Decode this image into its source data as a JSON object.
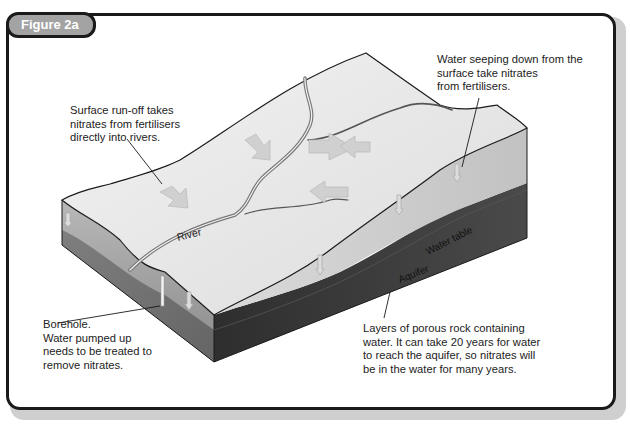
{
  "figure": {
    "label": "Figure 2a"
  },
  "diagram": {
    "labels": {
      "river": "River",
      "water_table": "Water table",
      "aquifer": "Aquifer"
    },
    "callouts": {
      "surface_runoff": "Surface run-off takes\nnitrates from fertilisers\ndirectly into rivers.",
      "water_seeping": "Water seeping down from the\nsurface take nitrates\nfrom fertilisers.",
      "borehole": "Borehole.\nWater pumped up\nneeds to be treated to\nremove nitrates.",
      "aquifer_layers": "Layers of porous rock containing\nwater. It can take 20 years for water\nto reach the aquifer, so nitrates will\nbe in the water for many years."
    },
    "colors": {
      "surface": "#e6e6e6",
      "soil_side": "#9a9a9a",
      "aquifer": "#3c3c3c",
      "frame": "#1a1a1a",
      "tab": "#a3a3a3"
    }
  }
}
